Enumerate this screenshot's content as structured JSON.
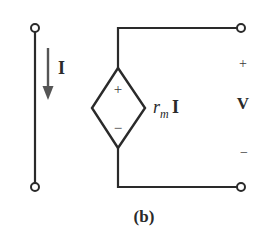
{
  "diagram": {
    "type": "circuit",
    "caption": "(b)",
    "current_label": "I",
    "source": {
      "kind": "current-controlled voltage source",
      "plus": "+",
      "minus": "−",
      "gain_symbol": "r",
      "gain_subscript": "m",
      "controlling_variable": "I"
    },
    "output": {
      "plus": "+",
      "label": "V",
      "minus": "−"
    },
    "colors": {
      "wire": "#2a2a2a",
      "arrow": "#555555",
      "background": "#ffffff"
    }
  }
}
